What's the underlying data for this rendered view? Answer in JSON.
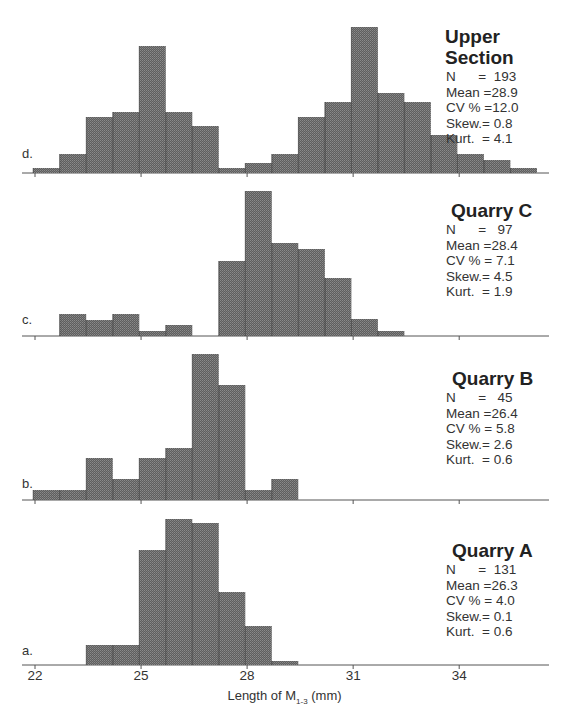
{
  "chart_data": {
    "type": "bar",
    "subtype": "histogram-stacked-panels",
    "xlabel": "Length of M1-3 (mm)",
    "xlabel_main": "Length of M",
    "xlabel_sub": "1-3",
    "xlabel_unit": " (mm)",
    "x_ticks": [
      22,
      25,
      28,
      31,
      34
    ],
    "xlim": [
      21.9,
      36.2
    ],
    "bin_width": 0.75,
    "bin_start": 21.95,
    "grid": false,
    "legend": "none",
    "panels": [
      {
        "id": "d",
        "letter": "d.",
        "title_lines": [
          "Upper",
          "Section"
        ],
        "stats": {
          "N": "193",
          "Mean": "28.9",
          "CV": "12.0",
          "Skew": "0.8",
          "Kurt": "4.1"
        },
        "bin_indices": [
          0,
          1,
          2,
          3,
          4,
          5,
          6,
          7,
          8,
          9,
          10,
          11,
          12,
          13,
          14,
          15,
          16,
          17,
          18
        ],
        "relative_heights": [
          5,
          19,
          56,
          61,
          127,
          61,
          47,
          5,
          10,
          19,
          56,
          71,
          146,
          80,
          71,
          38,
          19,
          13,
          5
        ]
      },
      {
        "id": "c",
        "letter": "c.",
        "title_lines": [
          "Quarry C"
        ],
        "stats": {
          "N": "97",
          "Mean": "28.4",
          "CV": "7.1",
          "Skew": "4.5",
          "Kurt": "1.9"
        },
        "bin_indices": [
          1,
          2,
          3,
          4,
          5,
          7,
          8,
          9,
          10,
          11,
          12,
          13
        ],
        "relative_heights": [
          22,
          16,
          22,
          5,
          11,
          75,
          145,
          93,
          87,
          58,
          17,
          5
        ]
      },
      {
        "id": "b",
        "letter": "b.",
        "title_lines": [
          "Quarry B"
        ],
        "stats": {
          "N": "45",
          "Mean": "26.4",
          "CV": "5.8",
          "Skew": "2.6",
          "Kurt": "0.6"
        },
        "bin_indices": [
          0,
          1,
          2,
          3,
          4,
          5,
          6,
          7,
          8,
          9
        ],
        "relative_heights": [
          10,
          10,
          42,
          21,
          42,
          52,
          146,
          115,
          10,
          21
        ]
      },
      {
        "id": "a",
        "letter": "a.",
        "title_lines": [
          "Quarry A"
        ],
        "stats": {
          "N": "131",
          "Mean": "26.3",
          "CV": "4.0",
          "Skew": "0.1",
          "Kurt": "0.6"
        },
        "bin_indices": [
          2,
          3,
          4,
          5,
          6,
          7,
          8,
          9
        ],
        "relative_heights": [
          20,
          20,
          115,
          146,
          142,
          73,
          39,
          4
        ]
      }
    ]
  },
  "colors": {
    "bar_fill": "#6a6a6a",
    "bar_divider": "#222222",
    "axis": "#555555"
  },
  "stat_labels": {
    "N": "N      =",
    "Mean": "Mean =",
    "CV": "CV % =",
    "Skew": "Skew.=",
    "Kurt": "Kurt.  ="
  }
}
